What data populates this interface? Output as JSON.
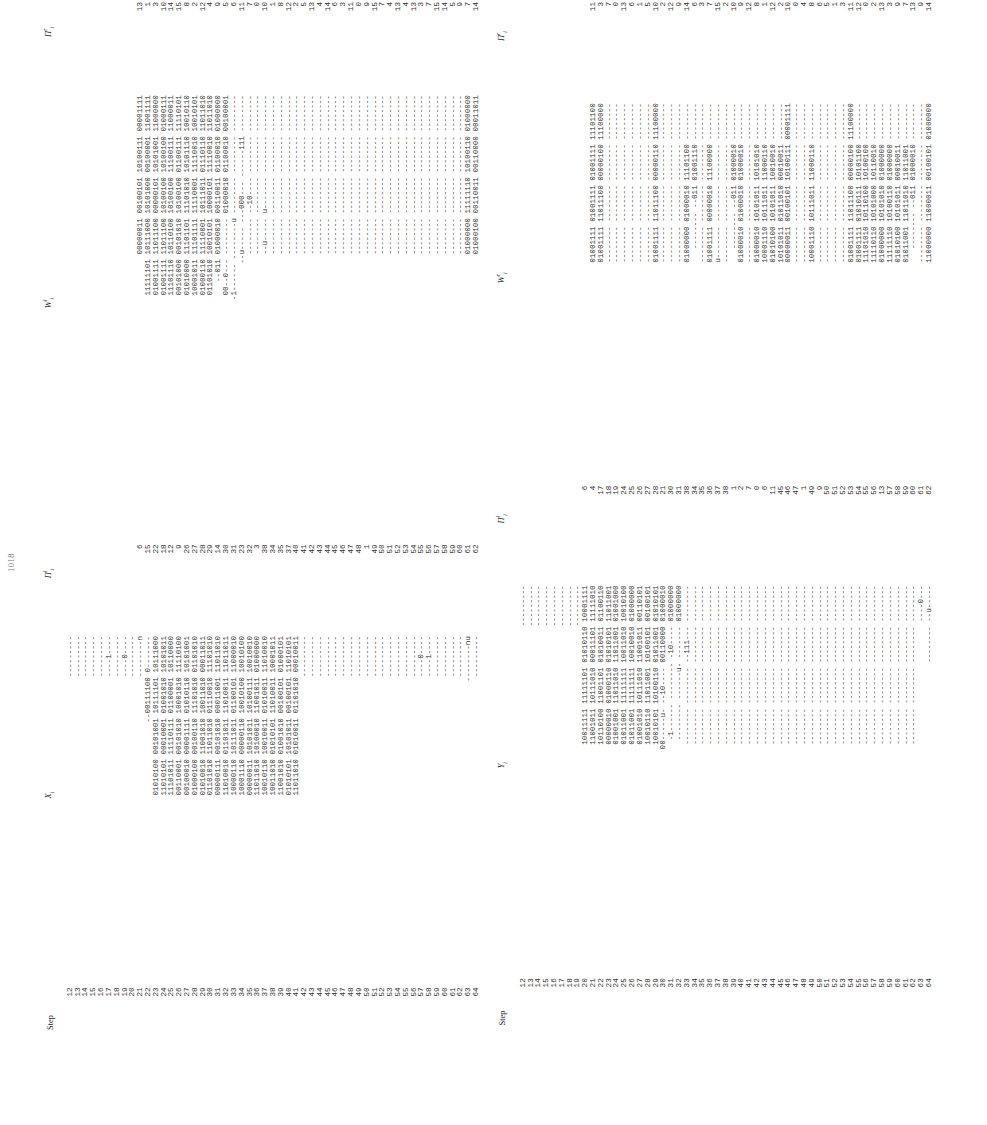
{
  "page": {
    "number": "1018"
  },
  "tables": [
    {
      "id": "table-x",
      "columns": {
        "step": "Step",
        "value": "X",
        "value_sub": "i",
        "pi_left": "Π",
        "pi_left_sub": "i",
        "pi_left_sup": "l",
        "w_left": "W",
        "w_left_sub": "i",
        "w_left_sup": "l",
        "pi_right": "Π",
        "pi_right_sub": "i",
        "pi_right_sup": "r"
      },
      "rows": [
        {
          "step": "12",
          "x": "---------",
          "pi": "",
          "w": "",
          "pi2": ""
        },
        {
          "step": "13",
          "x": "---------",
          "pi": "",
          "w": "",
          "pi2": ""
        },
        {
          "step": "14",
          "x": "---------",
          "pi": "",
          "w": "",
          "pi2": ""
        },
        {
          "step": "15",
          "x": "---------",
          "pi": "",
          "w": "",
          "pi2": ""
        },
        {
          "step": "16",
          "x": "---------",
          "pi": "",
          "w": "",
          "pi2": ""
        },
        {
          "step": "17",
          "x": "----1----",
          "pi": "",
          "w": "",
          "pi2": ""
        },
        {
          "step": "18",
          "x": "---------",
          "pi": "",
          "w": "",
          "pi2": ""
        },
        {
          "step": "19",
          "x": "----0----",
          "pi": "",
          "w": "",
          "pi2": ""
        },
        {
          "step": "20",
          "x": "---------",
          "pi": "",
          "w": "",
          "pi2": ""
        },
        {
          "step": "21",
          "x": "--------n",
          "pi": "6",
          "w": "00000011 00100101 10100111 00001111",
          "pi2": "13"
        },
        {
          "step": "22",
          "x": "--00111100 0-------",
          "pi": "15",
          "w": "11111101 10111000 10101000 00100001 11001111",
          "pi2": "1"
        },
        {
          "step": "23",
          "x": "01010100 00101001 10111101 10111000",
          "pi": "22",
          "w": "01001111 11011100 00000101 10101001 11000000",
          "pi2": "3"
        },
        {
          "step": "24",
          "x": "11010101 00010001 01001010 10101011",
          "pi": "18",
          "w": "01001111 11011100 10100100 10100100 01000111",
          "pi2": "10"
        },
        {
          "step": "25",
          "x": "11101011 11110111 01100001 10110000",
          "pi": "12",
          "w": "11101110 10110100 10100100 11100111 11000011",
          "pi2": "14"
        },
        {
          "step": "26",
          "x": "00110001 00101010 10001010 11110100",
          "pi": "9",
          "w": "00101000 00101010 10100100 01100111 11110101",
          "pi2": "15"
        },
        {
          "step": "27",
          "x": "00100010 00001111 01010110 10101001",
          "pi": "26",
          "w": "01010000 11101101 11101010 10101110 10010110",
          "pi2": "8"
        },
        {
          "step": "28",
          "x": "01000100 00100110 11101010 01101010",
          "pi": "27",
          "w": "10001011 11101111 11110001 11110010 10010101",
          "pi2": "2"
        },
        {
          "step": "29",
          "x": "01010010 11001010 10011010 00011011",
          "pi": "28",
          "w": "01000110 11110001 10111011 01110110 11011010",
          "pi2": "12"
        },
        {
          "step": "30",
          "x": "01101010 11011010 01110010 11101010",
          "pi": "29",
          "w": "01101010 10010101 10000101 11110010 11011010",
          "pi2": "4"
        },
        {
          "step": "31",
          "x": "00000111 00101010 00011001 11011010",
          "pi": "14",
          "w": "--011 01000010 00110011 01100010 01000000",
          "pi2": "9"
        },
        {
          "step": "32",
          "x": "11010010 01101011 11010011 11011011",
          "pi": "30",
          "w": "00--0--- -------- 01000010 01100010 00100001",
          "pi2": "5"
        },
        {
          "step": "33",
          "x": "10000110 10111011 01100101 11000010",
          "pi": "31",
          "w": "-1------ --------u -------- -------- --------",
          "pi2": "6"
        },
        {
          "step": "34",
          "x": "10001110 00000110 10010100 10010100",
          "pi": "23",
          "w": "--u----- ---000--- ------111 --------",
          "pi2": "11"
        },
        {
          "step": "35",
          "x": "00000011 10101011 10100111 10010010",
          "pi": "32",
          "w": "-------- --10---- -------- --------",
          "pi2": "7"
        },
        {
          "step": "36",
          "x": "11011010 10100010 11001011 01000000",
          "pi": "3",
          "w": "-------- -------- -------- --------",
          "pi2": "0"
        },
        {
          "step": "37",
          "x": "10010110 10010011 01010011 11010010",
          "pi": "38",
          "w": "--u----- u------- -------- --------",
          "pi2": "10"
        },
        {
          "step": "38",
          "x": "10011010 01010101 11010011 10001011",
          "pi": "34",
          "w": "-------- -------- -------- --------",
          "pi2": "1"
        },
        {
          "step": "39",
          "x": "11001010 01001010 00100101 01000101",
          "pi": "35",
          "w": "-------- -------- -------- --------",
          "pi2": "8"
        },
        {
          "step": "40",
          "x": "01010101 10101011 00100101 11010101",
          "pi": "37",
          "w": "-------- -------- -------- --------",
          "pi2": "12"
        },
        {
          "step": "41",
          "x": "11011010 01010011 01101010 00010011",
          "pi": "40",
          "w": "-------- -------- -------- --------",
          "pi2": "2"
        },
        {
          "step": "42",
          "x": "---------",
          "pi": "41",
          "w": "-------- -------- -------- --------",
          "pi2": "5"
        },
        {
          "step": "43",
          "x": "---------",
          "pi": "42",
          "w": "-------- -------- -------- --------",
          "pi2": "13"
        },
        {
          "step": "44",
          "x": "---------",
          "pi": "43",
          "w": "-------- -------- -------- --------",
          "pi2": "4"
        },
        {
          "step": "45",
          "x": "---------",
          "pi": "44",
          "w": "-------- -------- -------- --------",
          "pi2": "14"
        },
        {
          "step": "46",
          "x": "---------",
          "pi": "45",
          "w": "-------- -------- -------- --------",
          "pi2": "6"
        },
        {
          "step": "47",
          "x": "---------",
          "pi": "46",
          "w": "-------- -------- -------- --------",
          "pi2": "3"
        },
        {
          "step": "48",
          "x": "---------",
          "pi": "47",
          "w": "-------- -------- -------- --------",
          "pi2": "11"
        },
        {
          "step": "49",
          "x": "---------",
          "pi": "48",
          "w": "-------- -------- -------- --------",
          "pi2": "0"
        },
        {
          "step": "50",
          "x": "---------",
          "pi": "1",
          "w": "-------- -------- -------- --------",
          "pi2": "9"
        },
        {
          "step": "51",
          "x": "---------",
          "pi": "49",
          "w": "-------- -------- -------- --------",
          "pi2": "15"
        },
        {
          "step": "52",
          "x": "---------",
          "pi": "50",
          "w": "-------- -------- -------- --------",
          "pi2": "7"
        },
        {
          "step": "53",
          "x": "---------",
          "pi": "51",
          "w": "-------- -------- -------- --------",
          "pi2": "4"
        },
        {
          "step": "54",
          "x": "---------",
          "pi": "52",
          "w": "-------- -------- -------- --------",
          "pi2": "13"
        },
        {
          "step": "55",
          "x": "---------",
          "pi": "53",
          "w": "-------- -------- -------- --------",
          "pi2": "4"
        },
        {
          "step": "56",
          "x": "---------",
          "pi": "54",
          "w": "-------- -------- -------- --------",
          "pi2": "13"
        },
        {
          "step": "57",
          "x": "----0----",
          "pi": "55",
          "w": "-------- -------- -------- --------",
          "pi2": "3"
        },
        {
          "step": "58",
          "x": "----1----",
          "pi": "56",
          "w": "-------- -------- -------- --------",
          "pi2": "7"
        },
        {
          "step": "59",
          "x": "---------",
          "pi": "57",
          "w": "-------- -------- -------- --------",
          "pi2": "15"
        },
        {
          "step": "60",
          "x": "---------",
          "pi": "58",
          "w": "-------- -------- -------- --------",
          "pi2": "14"
        },
        {
          "step": "61",
          "x": "---------",
          "pi": "59",
          "w": "-------- -------- -------- --------",
          "pi2": "5"
        },
        {
          "step": "62",
          "x": "---------",
          "pi": "60",
          "w": "-------- -------- -------- --------",
          "pi2": "9"
        },
        {
          "step": "63",
          "x": "--------nu",
          "pi": "61",
          "w": "01000000 11111110 10100110 01000000",
          "pi2": "7"
        },
        {
          "step": "64",
          "x": "---------",
          "pi": "62",
          "w": "01000100 00110011 00110000 00011011",
          "pi2": "14"
        }
      ]
    },
    {
      "id": "table-y",
      "columns": {
        "step": "Step",
        "value": "Y",
        "value_sub": "i",
        "pi_left": "Π",
        "pi_left_sub": "i",
        "pi_left_sup": "l",
        "w_left": "W",
        "w_left_sub": "i",
        "w_left_sup": "r",
        "pi_right": "Π",
        "pi_right_sub": "i",
        "pi_right_sup": "r"
      },
      "rows": [
        {
          "step": "12",
          "y": "---------",
          "pi": "",
          "w": "",
          "pi2": ""
        },
        {
          "step": "13",
          "y": "---------",
          "pi": "",
          "w": "",
          "pi2": ""
        },
        {
          "step": "14",
          "y": "---------",
          "pi": "",
          "w": "",
          "pi2": ""
        },
        {
          "step": "15",
          "y": "---------",
          "pi": "",
          "w": "",
          "pi2": ""
        },
        {
          "step": "16",
          "y": "---------",
          "pi": "",
          "w": "",
          "pi2": ""
        },
        {
          "step": "17",
          "y": "---------",
          "pi": "",
          "w": "",
          "pi2": ""
        },
        {
          "step": "18",
          "y": "---------",
          "pi": "",
          "w": "",
          "pi2": ""
        },
        {
          "step": "19",
          "y": "---------",
          "pi": "",
          "w": "",
          "pi2": ""
        },
        {
          "step": "20",
          "y": "10011111 11111101 01010110 10001111",
          "pi": "6",
          "w": "",
          "pi2": ""
        },
        {
          "step": "21",
          "y": "11001011 10111010 00011101 11111010",
          "pi": "4",
          "w": "01001111 01001111 01001111 11101100",
          "pi2": "11"
        },
        {
          "step": "22",
          "y": "10110100 11001101 01010011 01100110",
          "pi": "17",
          "w": "01001111 11011100 00000100 11100000",
          "pi2": "3"
        },
        {
          "step": "23",
          "y": "00000010 01000110 01010101 11011001",
          "pi": "18",
          "w": "-------- -------- -------- --------",
          "pi2": "7"
        },
        {
          "step": "24",
          "y": "01001001 11011010 11011001 01001000",
          "pi": "19",
          "w": "-------- -------- -------- --------",
          "pi2": "0"
        },
        {
          "step": "25",
          "y": "01011001 11111111 10011010 10010100",
          "pi": "24",
          "w": "-------- -------- -------- --------",
          "pi2": "13"
        },
        {
          "step": "26",
          "y": "01011001 11111111 10010010 01000000",
          "pi": "25",
          "w": "-------- -------- -------- --------",
          "pi2": "6"
        },
        {
          "step": "27",
          "y": "01001010 10111010 11001011 00110101",
          "pi": "26",
          "w": "-------- -------- -------- --------",
          "pi2": "1"
        },
        {
          "step": "28",
          "y": "10010110 11011001 10100101 00100101",
          "pi": "27",
          "w": "-------- -------- -------- --------",
          "pi2": "5"
        },
        {
          "step": "29",
          "y": "10010101 10100110 01011001 01010101",
          "pi": "28",
          "w": "01001111 11011100 00000110 11100000",
          "pi2": "10"
        },
        {
          "step": "30",
          "y": "00-----u- --10---- 00110000 01000010",
          "pi": "21",
          "w": "-------- -------- -------- --------",
          "pi2": "2"
        },
        {
          "step": "31",
          "y": "-1------ -------- -10---- 01000000",
          "pi": "30",
          "w": "-------- -------- -------- --------",
          "pi2": "12"
        },
        {
          "step": "32",
          "y": "-------- ------u- ------- 01000000",
          "pi": "31",
          "w": "-------- -------- -------- --------",
          "pi2": "9"
        },
        {
          "step": "33",
          "y": "-------- -------- --111--- --------",
          "pi": "38",
          "w": "01000000 01000010 11101100 --------",
          "pi2": "14"
        },
        {
          "step": "34",
          "y": "-------- -------- -------- --------",
          "pi": "34",
          "w": "-------- --011 01001110 --------",
          "pi2": "6"
        },
        {
          "step": "35",
          "y": "-------- -------- -------- --------",
          "pi": "35",
          "w": "-------- -------- -------- --------",
          "pi2": "3"
        },
        {
          "step": "36",
          "y": "-------- -------- -------- --------",
          "pi": "36",
          "w": "01001111 00000010 11100000 --------",
          "pi2": "7"
        },
        {
          "step": "37",
          "y": "-------- -------- -------- --------",
          "pi": "37",
          "w": "u------- -------- -------- --------",
          "pi2": "15"
        },
        {
          "step": "38",
          "y": "-------- -------- -------- --------",
          "pi": "38",
          "w": "-------- -------- -------- --------",
          "pi2": "2"
        },
        {
          "step": "39",
          "y": "-------- -------- -------- --------",
          "pi": "1",
          "w": "-------- --011 01000010 --------",
          "pi2": "10"
        },
        {
          "step": "40",
          "y": "-------- -------- -------- --------",
          "pi": "2",
          "w": "01000010 01000010 01000010 --------",
          "pi2": "9"
        },
        {
          "step": "41",
          "y": "-------- -------- -------- --------",
          "pi": "7",
          "w": "-------- -------- -------- --------",
          "pi2": "12"
        },
        {
          "step": "42",
          "y": "-------- -------- -------- --------",
          "pi": "0",
          "w": "01000010 10101011 10101010 --------",
          "pi2": "8"
        },
        {
          "step": "43",
          "y": "-------- -------- -------- --------",
          "pi": "6",
          "w": "10001110 10111011 11000110 --------",
          "pi2": "1"
        },
        {
          "step": "44",
          "y": "-------- -------- -------- --------",
          "pi": "11",
          "w": "01010100 10101011 10010010 --------",
          "pi2": "12"
        },
        {
          "step": "45",
          "y": "-------- -------- -------- --------",
          "pi": "45",
          "w": "10101011 01011010 00010011 --------",
          "pi2": "2"
        },
        {
          "step": "46",
          "y": "-------- -------- -------- --------",
          "pi": "46",
          "w": "00000011 00100101 10100111 00001111",
          "pi2": "10"
        },
        {
          "step": "47",
          "y": "-------- -------- -------- --------",
          "pi": "47",
          "w": "-------- -------- -------- --------",
          "pi2": "0"
        },
        {
          "step": "48",
          "y": "-------- -------- -------- --------",
          "pi": "1",
          "w": "-------- -------- -------- --------",
          "pi2": "4"
        },
        {
          "step": "49",
          "y": "-------- -------- -------- --------",
          "pi": "49",
          "w": "10001110 10111011 11000110 --------",
          "pi2": "8"
        },
        {
          "step": "50",
          "y": "-------- -------- -------- --------",
          "pi": "9",
          "w": "-------- -------- -------- --------",
          "pi2": "6"
        },
        {
          "step": "51",
          "y": "-------- -------- -------- --------",
          "pi": "50",
          "w": "-------- -------- -------- --------",
          "pi2": "5"
        },
        {
          "step": "52",
          "y": "-------- -------- -------- --------",
          "pi": "51",
          "w": "-------- -------- -------- --------",
          "pi2": "1"
        },
        {
          "step": "53",
          "y": "-------- -------- -------- --------",
          "pi": "52",
          "w": "-------- -------- -------- --------",
          "pi2": "3"
        },
        {
          "step": "54",
          "y": "-------- -------- -------- --------",
          "pi": "53",
          "w": "01001111 11011100 00000100 11100000",
          "pi2": "11"
        },
        {
          "step": "55",
          "y": "-------- -------- -------- --------",
          "pi": "54",
          "w": "01001111 01010111 10101100 --------",
          "pi2": "12"
        },
        {
          "step": "56",
          "y": "-------- -------- -------- --------",
          "pi": "55",
          "w": "11101010 10110100 10100100 --------",
          "pi2": "0"
        },
        {
          "step": "57",
          "y": "-------- -------- -------- --------",
          "pi": "56",
          "w": "11110110 10101000 10110010 --------",
          "pi2": "2"
        },
        {
          "step": "58",
          "y": "-------- -------- -------- --------",
          "pi": "13",
          "w": "01000000 10101010 01000000 --------",
          "pi2": "13"
        },
        {
          "step": "59",
          "y": "-------- -------- -------- --------",
          "pi": "57",
          "w": "11111110 10100110 01000000 --------",
          "pi2": "3"
        },
        {
          "step": "60",
          "y": "-------- -------- -------- --------",
          "pi": "58",
          "w": "01010100 10101011 00010011 --------",
          "pi2": "9"
        },
        {
          "step": "61",
          "y": "-------- -------- -------- --------",
          "pi": "59",
          "w": "01011001 11011010 11011001 --------",
          "pi2": "7"
        },
        {
          "step": "62",
          "y": "-------- -------- -------- --------",
          "pi": "60",
          "w": "-------- --011 01000010 --------",
          "pi2": "13"
        },
        {
          "step": "63",
          "y": "----0---",
          "pi": "61",
          "w": "-------- -------- -------- --------",
          "pi2": "9"
        },
        {
          "step": "64",
          "y": "-------- --u-----",
          "pi": "62",
          "w": "11000000 11000011 00100101 01000000",
          "pi2": "14"
        }
      ]
    }
  ]
}
